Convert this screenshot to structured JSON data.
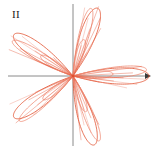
{
  "figure": {
    "label": "II",
    "width": 156,
    "height": 149,
    "background_color": "#ffffff"
  },
  "axes": {
    "origin_x": 73,
    "origin_y": 76,
    "color": "#8a8a8a",
    "x_axis": {
      "x_start": 8,
      "x_end": 151,
      "has_arrow_right": true,
      "arrow_color": "#3a3a3a"
    },
    "y_axis": {
      "y_start": 4,
      "y_end": 146,
      "has_arrow_top": false
    }
  },
  "chart_data": {
    "type": "line",
    "title": "II",
    "subtype": "polar-rose",
    "xlabel": "",
    "ylabel": "",
    "grid": false,
    "legend": null,
    "tick_labels": {
      "x": [],
      "y": []
    },
    "xlim": [
      -1.1,
      1.1
    ],
    "ylim": [
      -1.1,
      1.1
    ],
    "curve_color": "#e1502f",
    "curve_color_light": "#ef8a74",
    "curve_width": 0.8,
    "series": [
      {
        "name": "outer-rose",
        "equation": "r = cos(5*theta/2)",
        "petal_count": 5,
        "petal_angles_deg": [
          0,
          72,
          144,
          216,
          288
        ],
        "amplitude": 1.0,
        "theta_range_deg": [
          0,
          720
        ],
        "color": "#e1502f"
      },
      {
        "name": "inner-rose",
        "equation": "r = 0.52*cos(5*theta/2)",
        "petal_count": 5,
        "petal_angles_deg": [
          0,
          72,
          144,
          216,
          288
        ],
        "amplitude": 0.52,
        "theta_range_deg": [
          0,
          720
        ],
        "color": "#ef8a74"
      }
    ],
    "petals": [
      {
        "direction_deg": 0,
        "label": "right",
        "outer_length": 78,
        "inner_length": 41
      },
      {
        "direction_deg": 70,
        "label": "upper-right",
        "outer_length": 74,
        "inner_length": 39
      },
      {
        "direction_deg": 145,
        "label": "upper-left",
        "outer_length": 74,
        "inner_length": 39
      },
      {
        "direction_deg": 215,
        "label": "lower-left",
        "outer_length": 74,
        "inner_length": 39
      },
      {
        "direction_deg": 287,
        "label": "lower-right",
        "outer_length": 74,
        "inner_length": 39
      }
    ]
  }
}
